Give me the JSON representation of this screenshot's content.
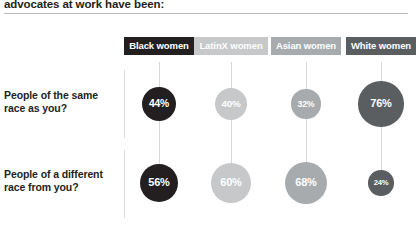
{
  "title": "advocates at work have been:",
  "columns": [
    {
      "label": "Black women",
      "color": "#231f20",
      "center_x": 159
    },
    {
      "label": "LatinX women",
      "color": "#c6c8c9",
      "center_x": 231
    },
    {
      "label": "Asian women",
      "color": "#a8abad",
      "center_x": 306
    },
    {
      "label": "White women",
      "color": "#5b5e60",
      "center_x": 381
    }
  ],
  "rows": [
    {
      "label": "People of the same race as you?",
      "center_y": 104
    },
    {
      "label": "People of a different race from you?",
      "center_y": 183
    }
  ],
  "chart_data": {
    "type": "scatter",
    "title": "advocates at work have been:",
    "xlabel": "",
    "ylabel": "",
    "categories": [
      "Black women",
      "LatinX women",
      "Asian women",
      "White women"
    ],
    "rows": [
      "People of the same race as you?",
      "People of a different race from you?"
    ],
    "series": [
      {
        "name": "People of the same race as you?",
        "values": [
          44,
          40,
          32,
          76
        ],
        "labels": [
          "44%",
          "40%",
          "32%",
          "76%"
        ]
      },
      {
        "name": "People of a different race from you?",
        "values": [
          56,
          60,
          68,
          24
        ],
        "labels": [
          "56%",
          "60%",
          "68%",
          "24%"
        ]
      }
    ],
    "unit": "%",
    "encoding": "bubble area proportional to percentage",
    "grid": false,
    "legend": "column headers"
  }
}
